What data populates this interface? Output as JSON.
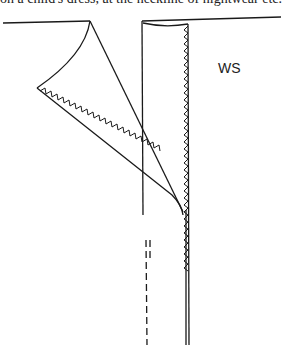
{
  "caption": "on a child's dress, at the neckline of nightwear etc.",
  "diagram": {
    "label_ws": "WS",
    "stroke_color": "#1a1a1a"
  }
}
